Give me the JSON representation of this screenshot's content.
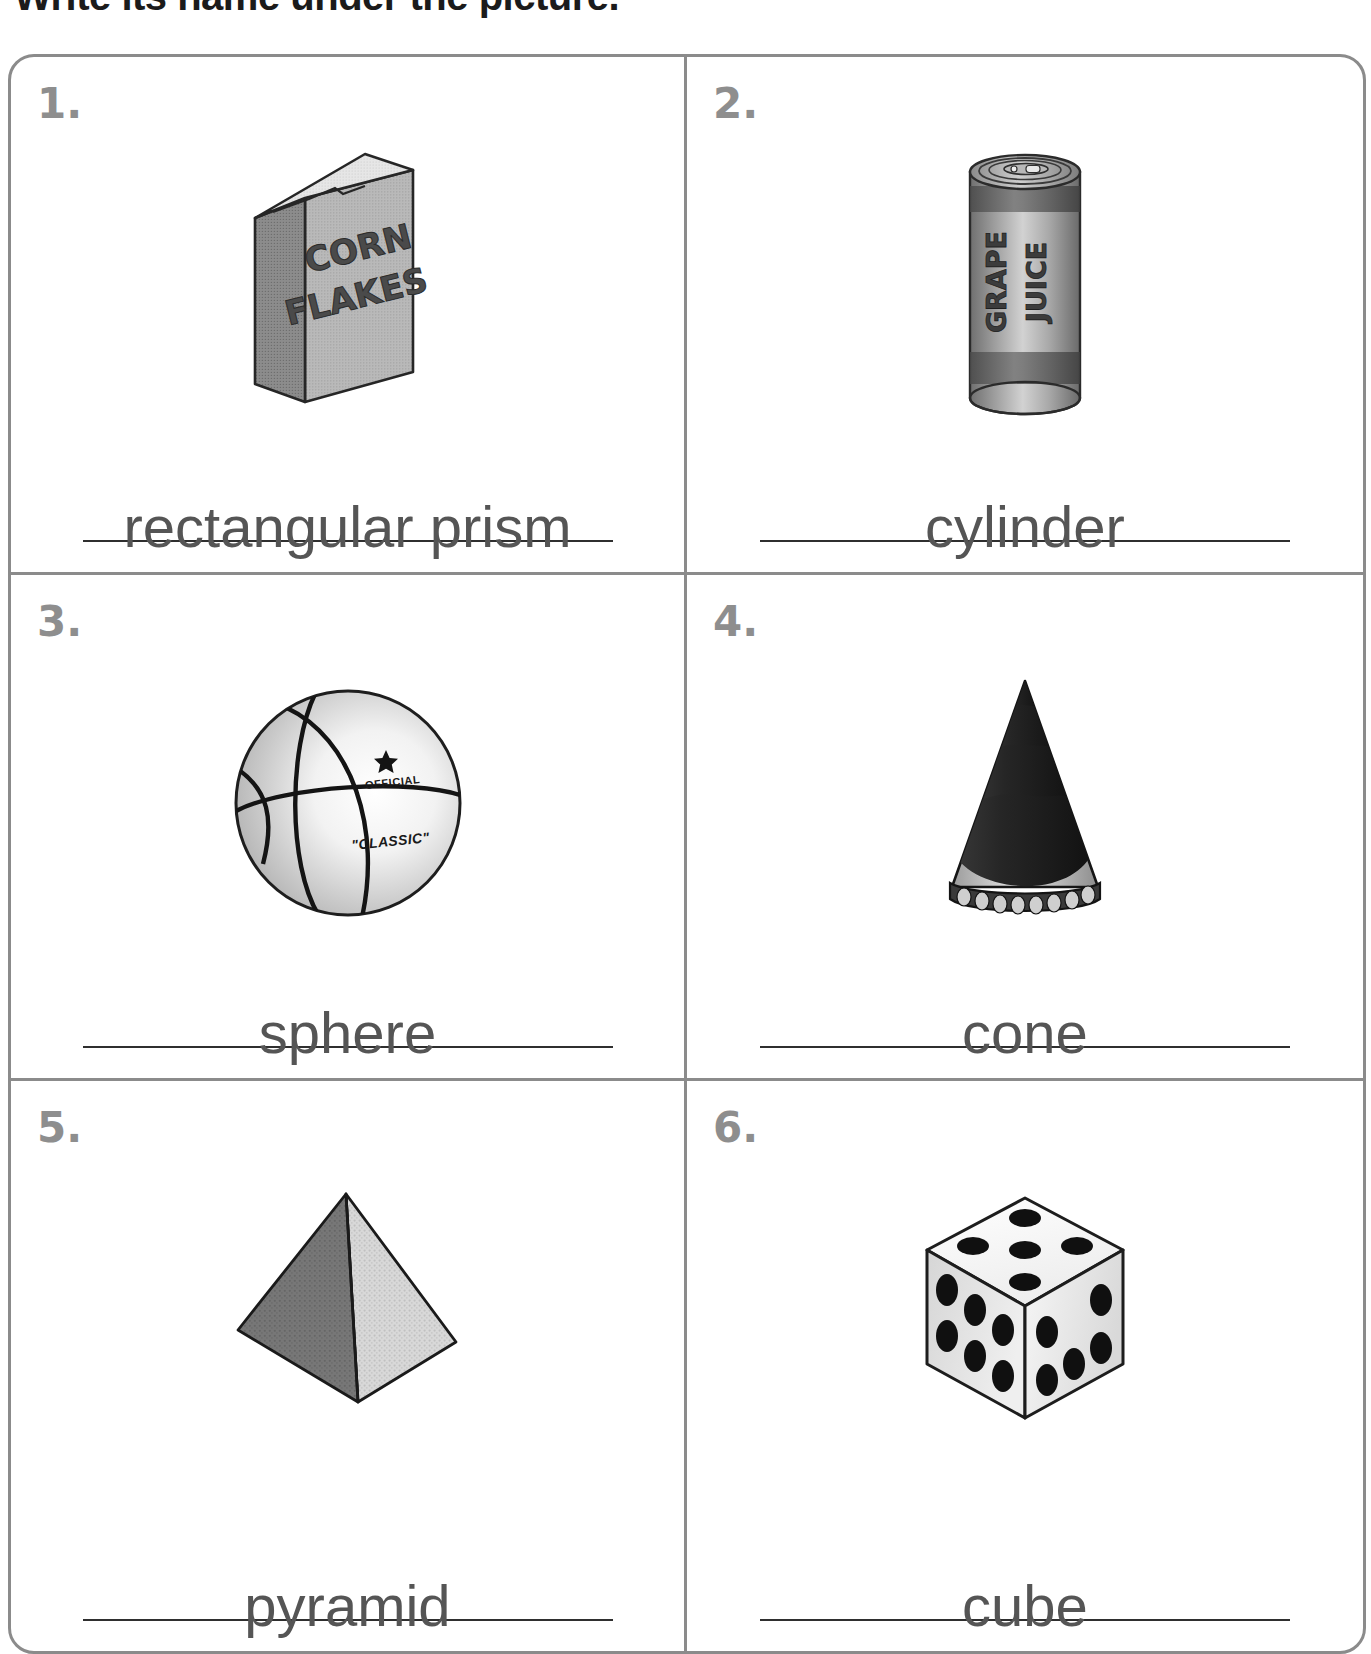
{
  "instruction": "Write its name under the picture.",
  "worksheet": {
    "columns": 2,
    "items": [
      {
        "number": "1.",
        "picture": "cereal-box",
        "picture_text_line1": "CORN",
        "picture_text_line2": "FLAKES",
        "answer": "rectangular prism"
      },
      {
        "number": "2.",
        "picture": "juice-can",
        "picture_text_line1": "GRAPE",
        "picture_text_line2": "JUICE",
        "answer": "cylinder"
      },
      {
        "number": "3.",
        "picture": "basketball",
        "picture_text_line1": "OFFICIAL",
        "picture_text_line2": "\"CLASSIC\"",
        "answer": "sphere"
      },
      {
        "number": "4.",
        "picture": "party-hat",
        "answer": "cone"
      },
      {
        "number": "5.",
        "picture": "pyramid",
        "answer": "pyramid"
      },
      {
        "number": "6.",
        "picture": "dice",
        "answer": "cube"
      }
    ]
  },
  "colors": {
    "frame": "#8b8b8b",
    "number": "#8e8e8e",
    "answer_text": "#555555",
    "rule": "#2f2f2f",
    "instruction": "#1b1b1b"
  }
}
